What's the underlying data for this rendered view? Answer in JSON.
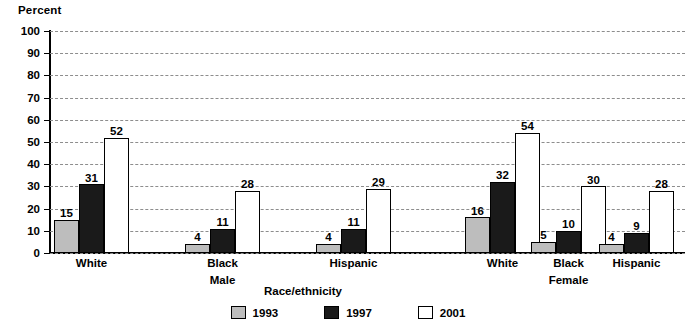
{
  "chart_data": {
    "type": "bar",
    "title": "",
    "ylabel": "Percent",
    "xlabel": "Race/ethnicity",
    "ylim": [
      0,
      100
    ],
    "ytick_step": 10,
    "yticks": [
      "100",
      "90",
      "80",
      "70",
      "60",
      "50",
      "40",
      "30",
      "20",
      "10",
      "0"
    ],
    "grid": true,
    "legend_position": "bottom-center",
    "categories": [
      "White",
      "Black",
      "Hispanic",
      "White",
      "Black",
      "Hispanic"
    ],
    "group_labels": [
      "Male",
      "Female"
    ],
    "series": [
      {
        "name": "1993",
        "color": "#bdbdbd",
        "values": [
          15,
          4,
          4,
          16,
          5,
          4
        ]
      },
      {
        "name": "1997",
        "color": "#1a1a1a",
        "values": [
          31,
          11,
          11,
          32,
          10,
          9
        ]
      },
      {
        "name": "2001",
        "color": "#ffffff",
        "values": [
          52,
          28,
          29,
          54,
          30,
          28
        ]
      }
    ]
  },
  "legend": {
    "items": [
      {
        "label": "1993",
        "swatch": "s1993"
      },
      {
        "label": "1997",
        "swatch": "s1997"
      },
      {
        "label": "2001",
        "swatch": "s2001"
      }
    ]
  }
}
